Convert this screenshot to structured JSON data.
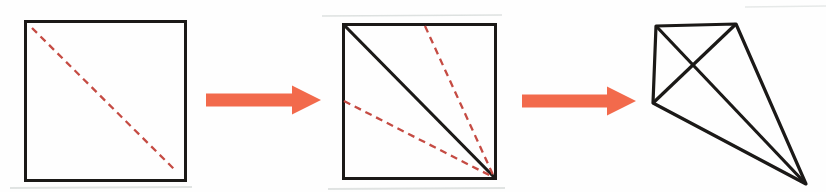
{
  "palette": {
    "ink": "#1b1917",
    "fold_red": "#c54b43",
    "arrow_coral": "#f26a4c",
    "paper": "#fefefe",
    "smudge": "#c3cac8"
  },
  "figures": [
    {
      "name": "scan-smudge-bottom-left",
      "type": "line",
      "x1": 10,
      "y1": 188,
      "x2": 192,
      "y2": 187,
      "stroke": "smudge",
      "stroke_width": 2,
      "opacity": 0.5
    },
    {
      "name": "scan-smudge-bottom-mid",
      "type": "line",
      "x1": 328,
      "y1": 189,
      "x2": 505,
      "y2": 188,
      "stroke": "smudge",
      "stroke_width": 2,
      "opacity": 0.5
    },
    {
      "name": "scan-smudge-top",
      "type": "line",
      "x1": 322,
      "y1": 16,
      "x2": 502,
      "y2": 15,
      "stroke": "smudge",
      "stroke_width": 1.7,
      "opacity": 0.55
    },
    {
      "name": "scan-smudge-top-right",
      "type": "line",
      "x1": 745,
      "y1": 7,
      "x2": 826,
      "y2": 6,
      "stroke": "smudge",
      "stroke_width": 1.5,
      "opacity": 0.4
    },
    {
      "name": "step1-square-outline",
      "type": "rect",
      "x": 25.5,
      "y": 21.5,
      "w": 160,
      "h": 159,
      "stroke": "ink",
      "stroke_width": 3
    },
    {
      "name": "step1-valley-fold-line",
      "type": "line",
      "x1": 32,
      "y1": 28,
      "x2": 175,
      "y2": 170,
      "stroke": "fold_red",
      "stroke_width": 2.3,
      "dash": "7 5"
    },
    {
      "name": "step-arrow-1",
      "type": "arrow",
      "x1": 206,
      "x2": 321,
      "y": 100,
      "shaft": 13,
      "head_w": 29,
      "head_len": 29,
      "fill": "arrow_coral"
    },
    {
      "name": "step2-square-outline",
      "type": "rect",
      "x": 343.5,
      "y": 24.5,
      "w": 152,
      "h": 154,
      "stroke": "ink",
      "stroke_width": 3
    },
    {
      "name": "step2-diagonal-crease",
      "type": "line",
      "x1": 344,
      "y1": 25,
      "x2": 495,
      "y2": 178,
      "stroke": "ink",
      "stroke_width": 3.2
    },
    {
      "name": "step2-valley-fold-top",
      "type": "line",
      "x1": 425,
      "y1": 26,
      "x2": 494,
      "y2": 177,
      "stroke": "fold_red",
      "stroke_width": 2.3,
      "dash": "7 5"
    },
    {
      "name": "step2-valley-fold-left",
      "type": "line",
      "x1": 344,
      "y1": 101,
      "x2": 493,
      "y2": 177,
      "stroke": "fold_red",
      "stroke_width": 2.3,
      "dash": "7 5"
    },
    {
      "name": "step-arrow-2",
      "type": "arrow",
      "x1": 522,
      "x2": 636,
      "y": 101,
      "shaft": 13,
      "head_w": 29,
      "head_len": 29,
      "fill": "arrow_coral"
    },
    {
      "name": "step3-kite-outline",
      "type": "polygon",
      "points": [
        [
          656,
          26
        ],
        [
          736,
          24
        ],
        [
          806,
          184
        ],
        [
          653,
          103
        ]
      ],
      "stroke": "ink",
      "stroke_width": 3.2,
      "linejoin": "round"
    },
    {
      "name": "step3-crease-long",
      "type": "line",
      "x1": 656,
      "y1": 26,
      "x2": 806,
      "y2": 184,
      "stroke": "ink",
      "stroke_width": 3.2
    },
    {
      "name": "step3-crease-cross",
      "type": "line",
      "x1": 736,
      "y1": 24,
      "x2": 653,
      "y2": 103,
      "stroke": "ink",
      "stroke_width": 3.2
    }
  ]
}
